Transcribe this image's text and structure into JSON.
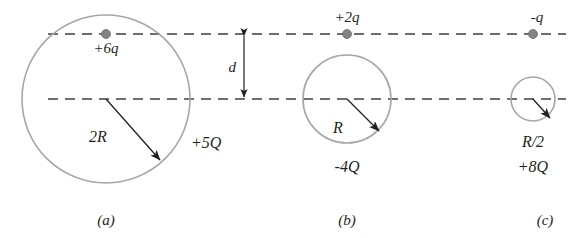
{
  "figure": {
    "width": 575,
    "height": 238,
    "background_color": "#ffffff",
    "line_color": "#6d6e71",
    "circle_color": "#a6a6a6",
    "dot_color": "#808285",
    "text_color": "#231f20"
  },
  "gap": {
    "label": "d",
    "arrow_style": "double-headed-vertical"
  },
  "panels": [
    {
      "key": "a",
      "caption": "(a)",
      "point_charge_label": "+6q",
      "point_charge_label_position": "below-line",
      "sphere_radius_label": "2R",
      "sphere_charge_label": "+5Q",
      "circle": {
        "cx": 106,
        "cy": 99,
        "r": 84
      },
      "charge_dot": {
        "cx": 106,
        "cy": 34,
        "r": 4.5
      },
      "radius_arrow": {
        "x1": 106,
        "y1": 99,
        "x2": 160,
        "y2": 160
      }
    },
    {
      "key": "b",
      "caption": "(b)",
      "point_charge_label": "+2q",
      "point_charge_label_position": "above-line",
      "sphere_radius_label": "R",
      "sphere_charge_label": "-4Q",
      "circle": {
        "cx": 347,
        "cy": 99,
        "r": 44
      },
      "charge_dot": {
        "cx": 347,
        "cy": 34,
        "r": 4.5
      },
      "radius_arrow": {
        "x1": 347,
        "y1": 99,
        "x2": 379,
        "y2": 131
      }
    },
    {
      "key": "c",
      "caption": "(c)",
      "point_charge_label": "-q",
      "point_charge_label_position": "above-line",
      "sphere_radius_label": "R/2",
      "sphere_charge_label": "+8Q",
      "circle": {
        "cx": 533,
        "cy": 99,
        "r": 22
      },
      "charge_dot": {
        "cx": 533,
        "cy": 34,
        "r": 4.5
      },
      "radius_arrow": {
        "x1": 533,
        "y1": 99,
        "x2": 549,
        "y2": 117
      }
    }
  ],
  "axes": {
    "upper_line_y": 34,
    "lower_line_y": 99,
    "x_start": 48,
    "x_end": 566
  }
}
